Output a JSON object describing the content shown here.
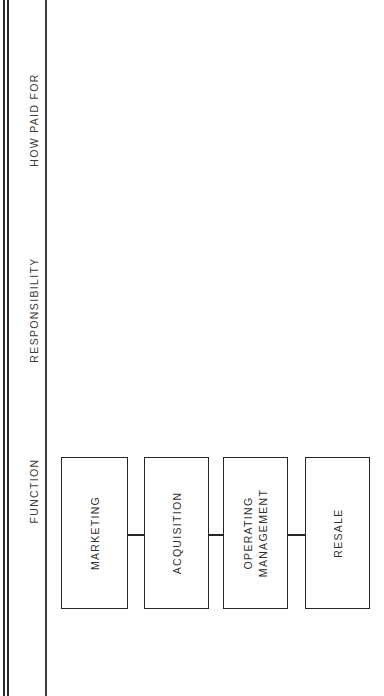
{
  "page": {
    "background_color": "#ffffff",
    "line_color": "#262626",
    "text_color": "#313131",
    "orientation": "rotated-90-ccw"
  },
  "rules": {
    "outer_double_rule_label": "page-edge-double-rule",
    "inner_rule_label": "column-divider-rule"
  },
  "columns": [
    {
      "id": "how-paid-for",
      "label": "HOW PAID FOR"
    },
    {
      "id": "responsibility",
      "label": "RESPONSIBILITY"
    },
    {
      "id": "function",
      "label": "FUNCTION"
    }
  ],
  "flow": {
    "type": "linear-chain",
    "nodes": [
      {
        "id": "marketing",
        "label": "MARKETING",
        "lines": [
          "MARKETING"
        ]
      },
      {
        "id": "acquisition",
        "label": "ACQUISITION",
        "lines": [
          "ACQUISITION"
        ]
      },
      {
        "id": "operating",
        "label": "OPERATING MANAGEMENT",
        "lines": [
          "OPERATING",
          "MANAGEMENT"
        ]
      },
      {
        "id": "resale",
        "label": "RESALE",
        "lines": [
          "RESALE"
        ]
      }
    ],
    "connectors": [
      {
        "from": "marketing",
        "to": "acquisition"
      },
      {
        "from": "acquisition",
        "to": "operating"
      },
      {
        "from": "operating",
        "to": "resale"
      }
    ]
  }
}
